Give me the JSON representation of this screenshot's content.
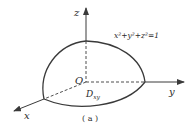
{
  "diagram": {
    "axes": {
      "x_label": "x",
      "y_label": "y",
      "z_label": "z",
      "origin_label": "O"
    },
    "surface_equation": "x²+y²+z²=1",
    "region_label": "D",
    "region_subscript": "xy",
    "caption": "( a )",
    "colors": {
      "stroke": "#3a3a3a",
      "background": "#ffffff"
    }
  }
}
